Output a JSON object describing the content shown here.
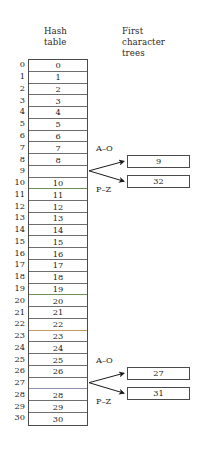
{
  "figure": {
    "headings": {
      "hash_table": "Hash\ntable",
      "first_character_trees": "First\ncharacter\ntrees"
    },
    "hash_table": {
      "index_min": 0,
      "index_max": 30,
      "rows": [
        {
          "index": "0",
          "value": "0",
          "empty": false
        },
        {
          "index": "1",
          "value": "1",
          "empty": false
        },
        {
          "index": "2",
          "value": "2",
          "empty": false
        },
        {
          "index": "3",
          "value": "3",
          "empty": false
        },
        {
          "index": "4",
          "value": "4",
          "empty": false
        },
        {
          "index": "5",
          "value": "5",
          "empty": false
        },
        {
          "index": "6",
          "value": "6",
          "empty": false
        },
        {
          "index": "7",
          "value": "7",
          "empty": false
        },
        {
          "index": "8",
          "value": "8",
          "empty": false
        },
        {
          "index": "9",
          "value": "",
          "empty": true
        },
        {
          "index": "10",
          "value": "10",
          "empty": false
        },
        {
          "index": "11",
          "value": "11",
          "empty": false
        },
        {
          "index": "12",
          "value": "12",
          "empty": false
        },
        {
          "index": "13",
          "value": "13",
          "empty": false
        },
        {
          "index": "14",
          "value": "14",
          "empty": false
        },
        {
          "index": "15",
          "value": "15",
          "empty": false
        },
        {
          "index": "16",
          "value": "16",
          "empty": false
        },
        {
          "index": "17",
          "value": "17",
          "empty": false
        },
        {
          "index": "18",
          "value": "18",
          "empty": false
        },
        {
          "index": "19",
          "value": "19",
          "empty": false
        },
        {
          "index": "20",
          "value": "20",
          "empty": false
        },
        {
          "index": "21",
          "value": "21",
          "empty": false
        },
        {
          "index": "22",
          "value": "22",
          "empty": false
        },
        {
          "index": "23",
          "value": "23",
          "empty": false
        },
        {
          "index": "24",
          "value": "24",
          "empty": false
        },
        {
          "index": "25",
          "value": "25",
          "empty": false
        },
        {
          "index": "26",
          "value": "26",
          "empty": false
        },
        {
          "index": "27",
          "value": "",
          "empty": true
        },
        {
          "index": "28",
          "value": "28",
          "empty": false
        },
        {
          "index": "29",
          "value": "29",
          "empty": false
        },
        {
          "index": "30",
          "value": "30",
          "empty": false
        }
      ]
    },
    "trees": [
      {
        "source_slot": "9",
        "branches": [
          {
            "label": "A–O",
            "node_value": "9"
          },
          {
            "label": "P–Z",
            "node_value": "32"
          }
        ]
      },
      {
        "source_slot": "27",
        "branches": [
          {
            "label": "A–O",
            "node_value": "27"
          },
          {
            "label": "P–Z",
            "node_value": "31"
          }
        ]
      }
    ],
    "colors": {
      "ink": "#1a1a1a",
      "rule": "#6e6e6e",
      "border": "#4a4a4a",
      "background": "#ffffff"
    }
  }
}
